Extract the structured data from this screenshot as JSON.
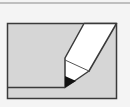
{
  "icon": {
    "name": "edit-icon",
    "description": "pencil writing on a sheet"
  },
  "colors": {
    "background": "#f4f4f4",
    "top_rule": "#8a8a8a",
    "sheet_fill": "#d6d6d6",
    "frame_stroke": "#3a3a3a",
    "pencil_body": "#ffffff",
    "pencil_tip": "#111111"
  }
}
